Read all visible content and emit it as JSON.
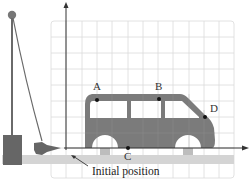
{
  "diagram": {
    "caption": "Initial position",
    "points": [
      {
        "label": "A",
        "x": 97,
        "y": 100
      },
      {
        "label": "B",
        "x": 159,
        "y": 99
      },
      {
        "label": "C",
        "x": 128,
        "y": 148
      },
      {
        "label": "D",
        "x": 205,
        "y": 117
      }
    ],
    "axes": {
      "origin": {
        "x": 66,
        "y": 148
      },
      "x_axis_end": 248,
      "y_axis_top": 3
    },
    "grid": {
      "left": 51,
      "right": 234,
      "top": 21,
      "bottom": 178,
      "spacing": 15.3
    },
    "colors": {
      "grid": "#d9d9d9",
      "vehicle": "#7a7a7a",
      "apparatus": "#666666",
      "ground": "#d2d2d2",
      "axis": "#333333"
    }
  }
}
